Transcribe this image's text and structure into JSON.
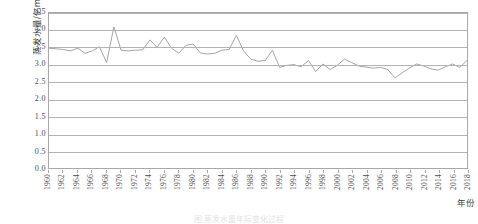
{
  "chart_data": {
    "type": "line",
    "title": "",
    "xlabel": "年份",
    "ylabel": "蒸发水量/亿m³",
    "ylabel_text": "蒸发水量/亿m",
    "ylabel_sup": "3",
    "ylim": [
      0.0,
      4.5
    ],
    "ytick_labels": [
      "0.0",
      "0.5",
      "1.0",
      "1.5",
      "2.0",
      "2.5",
      "3.0",
      "3.5",
      "4.0",
      "4.5"
    ],
    "ytick_values": [
      0.0,
      0.5,
      1.0,
      1.5,
      2.0,
      2.5,
      3.0,
      3.5,
      4.0,
      4.5
    ],
    "xlim": [
      1960,
      2018
    ],
    "xtick_labels": [
      "1960",
      "1962",
      "1964",
      "1966",
      "1968",
      "1970",
      "1972",
      "1974",
      "1976",
      "1978",
      "1980",
      "1982",
      "1984",
      "1986",
      "1988",
      "1990",
      "1992",
      "1994",
      "1996",
      "1998",
      "2000",
      "2002",
      "2004",
      "2006",
      "2008",
      "2010",
      "2012",
      "2014",
      "2016",
      "2018"
    ],
    "grid": "horizontal",
    "legend": "none",
    "line_color": "#9a9a9a",
    "frame_color": "#a8a8a8",
    "x": [
      1960,
      1961,
      1962,
      1963,
      1964,
      1965,
      1966,
      1967,
      1968,
      1969,
      1970,
      1971,
      1972,
      1973,
      1974,
      1975,
      1976,
      1977,
      1978,
      1979,
      1980,
      1981,
      1982,
      1983,
      1984,
      1985,
      1986,
      1987,
      1988,
      1989,
      1990,
      1991,
      1992,
      1993,
      1994,
      1995,
      1996,
      1997,
      1998,
      1999,
      2000,
      2001,
      2002,
      2003,
      2004,
      2005,
      2006,
      2007,
      2008,
      2009,
      2010,
      2011,
      2012,
      2013,
      2014,
      2015,
      2016,
      2017,
      2018
    ],
    "values": [
      3.48,
      3.46,
      3.44,
      3.4,
      3.48,
      3.33,
      3.4,
      3.52,
      3.06,
      4.1,
      3.42,
      3.4,
      3.42,
      3.43,
      3.72,
      3.5,
      3.8,
      3.48,
      3.33,
      3.56,
      3.6,
      3.34,
      3.31,
      3.33,
      3.42,
      3.44,
      3.85,
      3.4,
      3.16,
      3.1,
      3.12,
      3.42,
      2.92,
      2.98,
      3.0,
      2.94,
      3.12,
      2.8,
      3.02,
      2.86,
      2.98,
      3.16,
      3.06,
      2.96,
      2.93,
      2.9,
      2.92,
      2.86,
      2.62,
      2.76,
      2.9,
      3.02,
      2.96,
      2.88,
      2.84,
      2.94,
      3.02,
      2.92,
      3.12
    ],
    "series_name": "蒸发水量"
  },
  "caption": {
    "text": "图 蒸发水量年际变化过程"
  }
}
